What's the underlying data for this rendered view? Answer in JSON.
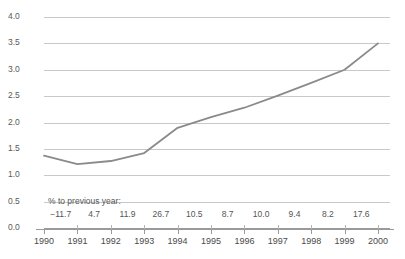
{
  "chart_data": {
    "type": "line",
    "title": "",
    "xlabel": "",
    "ylabel": "",
    "categories": [
      "1990",
      "1991",
      "1992",
      "1993",
      "1994",
      "1995",
      "1996",
      "1997",
      "1998",
      "1999",
      "2000"
    ],
    "values": [
      1.37,
      1.21,
      1.27,
      1.42,
      1.9,
      2.1,
      2.28,
      2.51,
      2.75,
      3.0,
      3.5
    ],
    "series": [
      {
        "name": "value",
        "values": [
          1.37,
          1.21,
          1.27,
          1.42,
          1.9,
          2.1,
          2.28,
          2.51,
          2.75,
          3.0,
          3.5
        ]
      }
    ],
    "ylim": [
      0.0,
      4.0
    ],
    "y_ticks": [
      "0.0",
      "0.5",
      "1.0",
      "1.5",
      "2.0",
      "2.5",
      "3.0",
      "3.5",
      "4.0"
    ],
    "y_tick_values": [
      0.0,
      0.5,
      1.0,
      1.5,
      2.0,
      2.5,
      3.0,
      3.5,
      4.0
    ],
    "grid": true,
    "legend": "none",
    "line_color": "#8a8a8a",
    "grid_color": "#c9c9c9",
    "axis_color": "#9a9a9a",
    "annotation": {
      "label": "% to previous year:",
      "values": [
        "−11.7",
        "4.7",
        "11.9",
        "26.7",
        "10.5",
        "8.7",
        "10.0",
        "9.4",
        "8.2",
        "17.6"
      ],
      "numeric_values": [
        -11.7,
        4.7,
        11.9,
        26.7,
        10.5,
        8.7,
        10.0,
        9.4,
        8.2,
        17.6
      ]
    }
  }
}
